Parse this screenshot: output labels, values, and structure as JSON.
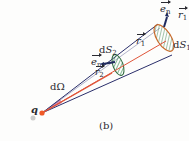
{
  "figure": {
    "caption": "(b)",
    "charge_label": "q",
    "solid_angle_label": "dΩ",
    "surface1": {
      "label_prefix": "d",
      "label_var": "S",
      "label_sub": "1"
    },
    "surface2": {
      "label_prefix": "d",
      "label_var": "S",
      "label_sub": "2"
    },
    "normal1": {
      "var": "e",
      "sub": "n"
    },
    "normal2": {
      "var": "e",
      "sub": "n"
    },
    "radius1_inside": {
      "var": "r",
      "sub": "1"
    },
    "radius1_outside": {
      "var": "r",
      "sub": "1"
    },
    "radius2": {
      "var": "r",
      "sub": "2"
    }
  },
  "colors": {
    "cone_lines": "#2b2f6b",
    "radius_line": "#e0553a",
    "surface_hatch_small": "#2e8a4e",
    "surface_hatch_large": "#c96a2a",
    "normal_arrow": "#1f2a5e",
    "charge_point": "#f05a28",
    "solid_angle_fill": "#c24a8a"
  }
}
